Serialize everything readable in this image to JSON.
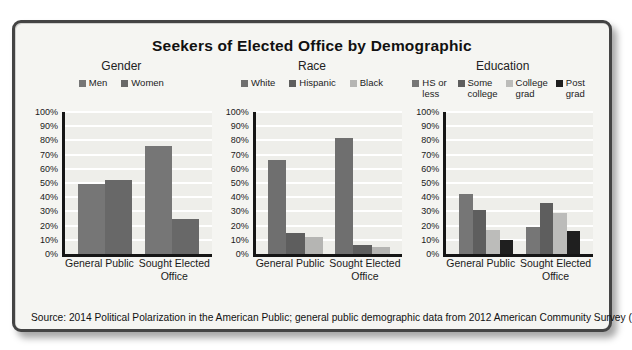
{
  "frame": {
    "title": "Seekers of Elected Office by Demographic",
    "source": "Source: 2014 Political Polarization in the American Public; general public demographic data from 2012 American Community Survey (1% IPUMS)."
  },
  "axis": {
    "ticks": [
      "100%",
      "90%",
      "80%",
      "70%",
      "60%",
      "50%",
      "40%",
      "30%",
      "20%",
      "10%",
      "0%"
    ],
    "ylim": [
      0,
      100
    ],
    "grid": "on"
  },
  "chart_data": [
    {
      "type": "bar",
      "title": "Gender",
      "categories": [
        "General Public",
        "Sought Elected Office"
      ],
      "series": [
        {
          "name": "Men",
          "color": "#767676",
          "values": [
            49,
            76
          ]
        },
        {
          "name": "Women",
          "color": "#686868",
          "values": [
            52,
            25
          ]
        }
      ],
      "ylim": [
        0,
        100
      ],
      "legend_position": "top"
    },
    {
      "type": "bar",
      "title": "Race",
      "categories": [
        "General Public",
        "Sought Elected Office"
      ],
      "series": [
        {
          "name": "White",
          "color": "#6f6f6f",
          "values": [
            66,
            82
          ]
        },
        {
          "name": "Hispanic",
          "color": "#5e5e5e",
          "values": [
            15,
            6
          ]
        },
        {
          "name": "Black",
          "color": "#b5b5b3",
          "values": [
            12,
            5
          ]
        }
      ],
      "ylim": [
        0,
        100
      ],
      "legend_position": "top"
    },
    {
      "type": "bar",
      "title": "Education",
      "categories": [
        "General Public",
        "Sought Elected Office"
      ],
      "series": [
        {
          "name": "HS or less",
          "color": "#767676",
          "values": [
            42,
            19
          ]
        },
        {
          "name": "Some college",
          "color": "#5e5e5e",
          "values": [
            31,
            36
          ]
        },
        {
          "name": "College grad",
          "color": "#bcbcba",
          "values": [
            17,
            29
          ]
        },
        {
          "name": "Post grad",
          "color": "#1f1f1f",
          "values": [
            10,
            16
          ]
        }
      ],
      "ylim": [
        0,
        100
      ],
      "legend_position": "top"
    }
  ]
}
